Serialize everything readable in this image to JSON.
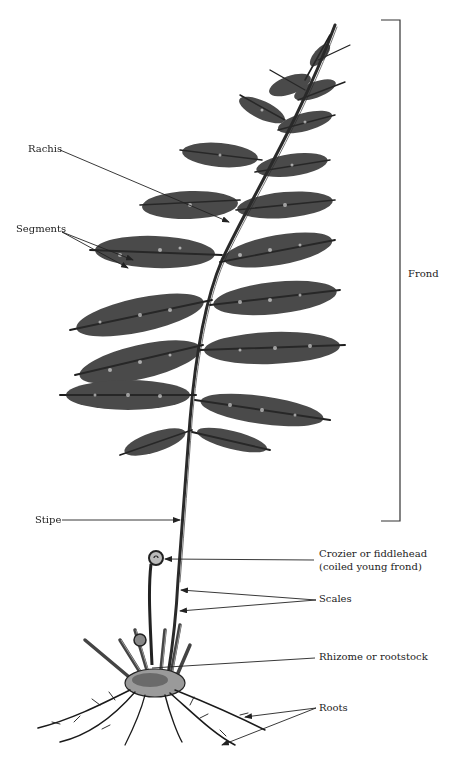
{
  "diagram": {
    "labels": {
      "rachis": "Rachis",
      "segments": "Segments",
      "frond": "Frond",
      "stipe": "Stipe",
      "crozier_line1": "Crozier or fiddlehead",
      "crozier_line2": "(coiled young frond)",
      "scales": "Scales",
      "rhizome": "Rhizome or rootstock",
      "roots": "Roots"
    },
    "colors": {
      "ink": "#222222",
      "background": "#ffffff"
    }
  }
}
